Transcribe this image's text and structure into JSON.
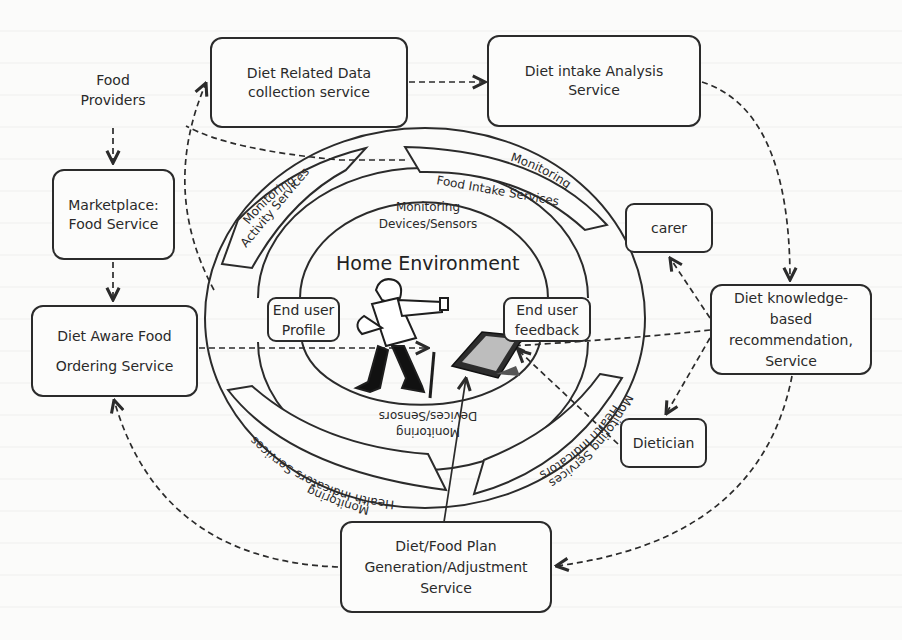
{
  "diagram": {
    "title": "Home Environment",
    "nodes": {
      "food_providers": {
        "lines": [
          "Food",
          "Providers"
        ]
      },
      "diet_related_data": {
        "lines": [
          "Diet Related Data",
          "collection service"
        ]
      },
      "diet_intake_analysis": {
        "lines": [
          "Diet intake Analysis",
          "Service"
        ]
      },
      "marketplace": {
        "lines": [
          "Marketplace:",
          "Food Service"
        ]
      },
      "diet_aware_ordering": {
        "lines": [
          "Diet Aware Food",
          "Ordering Service"
        ]
      },
      "carer": {
        "lines": [
          "carer"
        ]
      },
      "diet_knowledge": {
        "lines": [
          "Diet knowledge-",
          "based",
          "recommendation,",
          "Service"
        ]
      },
      "dietician": {
        "lines": [
          "Dietician"
        ]
      },
      "diet_food_plan": {
        "lines": [
          "Diet/Food Plan",
          "Generation/Adjustment",
          "Service"
        ]
      },
      "end_user_profile": {
        "lines": [
          "End user",
          "Profile"
        ]
      },
      "end_user_feedback": {
        "lines": [
          "End user",
          "feedback"
        ]
      }
    },
    "ring_labels": {
      "monitoring_activity": [
        "Monitoring",
        "Activity Services"
      ],
      "monitoring_food_intake": [
        "Monitoring",
        "Food Intake Services"
      ],
      "monitoring_devices_top": [
        "Monitoring",
        "Devices/Sensors"
      ],
      "monitoring_devices_bottom": [
        "Monitoring",
        "Devices/Sensors"
      ],
      "health_indicators_left": [
        "Monitoring",
        "Health Indicators Services"
      ],
      "health_indicators_right": [
        "Health Indicators",
        "Monitoring Services"
      ]
    },
    "colors": {
      "stroke": "#2b2b2b",
      "background": "#fbfbfa",
      "text": "#2a2a2a"
    }
  }
}
